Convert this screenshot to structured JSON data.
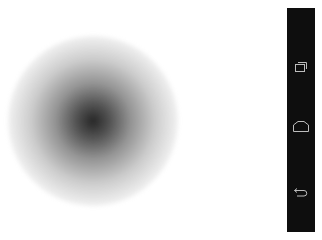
{
  "screen": {
    "background": "#ffffff"
  },
  "content": {
    "image": {
      "description": "blurred dark radial blob",
      "center_color": "#141414",
      "edge_color": "#ffffff"
    }
  },
  "navbar": {
    "background": "#0e0e0e",
    "icon_color": "#bdbdbd",
    "buttons": [
      {
        "name": "recent-apps",
        "icon": "recent-apps-icon",
        "label": "Recent apps"
      },
      {
        "name": "home",
        "icon": "home-icon",
        "label": "Home"
      },
      {
        "name": "back",
        "icon": "back-icon",
        "label": "Back"
      }
    ]
  }
}
